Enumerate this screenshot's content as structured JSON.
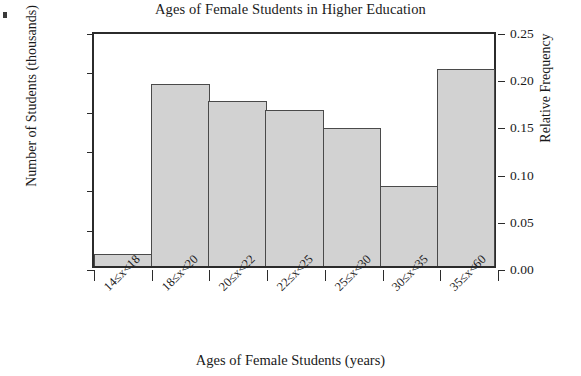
{
  "chart_data": {
    "type": "bar",
    "title": "Ages of Female Students in Higher Education",
    "xlabel": "Ages of Female Students (years)",
    "ylabel": "Number of Students (thousands)",
    "ylabel_right": "Relative Frequency",
    "categories": [
      "14≤x<18",
      "18≤x<20",
      "20≤x<22",
      "22≤x<25",
      "25≤x<30",
      "30≤x<35",
      "35≤x<60"
    ],
    "values": [
      150,
      2320,
      2100,
      1980,
      1750,
      1020,
      2510
    ],
    "relative_frequency": [
      0.0125,
      0.193,
      0.175,
      0.165,
      0.146,
      0.085,
      0.209
    ],
    "ylim": [
      0,
      3000
    ],
    "ylim_right": [
      0.0,
      0.25
    ],
    "yticks": [
      0,
      500,
      1000,
      1500,
      2000,
      2500,
      3000
    ],
    "ytick_labels": [
      "0",
      "500",
      "1000",
      "1500",
      "2000",
      "2500",
      "3000"
    ],
    "yticks_right": [
      0.0,
      0.05,
      0.1,
      0.15,
      0.2,
      0.25
    ],
    "ytick_labels_right": [
      "0.00",
      "0.05",
      "0.10",
      "0.15",
      "0.20",
      "0.25"
    ],
    "grid": false,
    "legend": false,
    "bar_fill_color": "#d2d2d2",
    "bar_edge_color": "#4a4a4a",
    "axis_color": "#2b2b2b",
    "background_color": "#ffffff"
  }
}
